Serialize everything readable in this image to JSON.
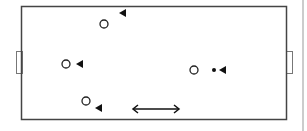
{
  "diagram": {
    "type": "soccer-pitch-drill",
    "field": {
      "x": 21,
      "y": 6,
      "w": 265,
      "h": 113,
      "stroke": "#444444"
    },
    "goals": [
      {
        "side": "left",
        "x": 16,
        "y": 51,
        "w": 6,
        "h": 22
      },
      {
        "side": "right",
        "x": 286,
        "y": 51,
        "w": 6,
        "h": 22
      }
    ],
    "side_line": {
      "x": 303,
      "y1": 0,
      "y2": 131,
      "color": "#bbbbbb"
    },
    "players_circle": [
      {
        "cx": 104,
        "cy": 24
      },
      {
        "cx": 66,
        "cy": 64
      },
      {
        "cx": 86,
        "cy": 101
      },
      {
        "cx": 194,
        "cy": 70
      }
    ],
    "players_triangle": [
      {
        "x": 119,
        "y": 13,
        "dir": "left"
      },
      {
        "x": 76,
        "y": 64,
        "dir": "left"
      },
      {
        "x": 95,
        "y": 108,
        "dir": "left"
      },
      {
        "x": 219,
        "y": 70,
        "dir": "left"
      }
    ],
    "ball": {
      "cx": 214,
      "cy": 70
    },
    "double_arrow": {
      "x1": 133,
      "x2": 179,
      "y": 109
    }
  }
}
